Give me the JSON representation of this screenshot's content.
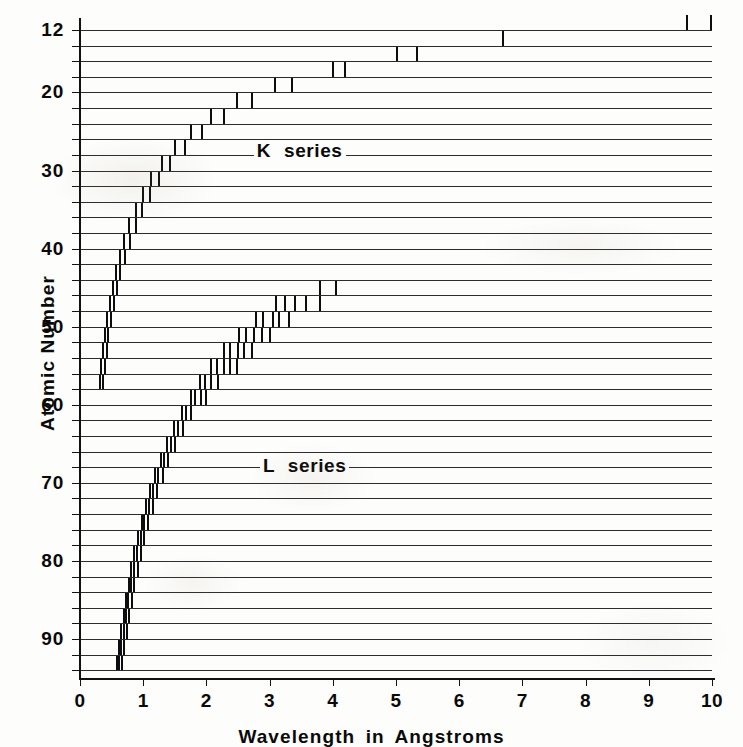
{
  "figure": {
    "title": "",
    "background_color": "#fdfdfb",
    "ink_color": "#0d0d0d"
  },
  "axes": {
    "x": {
      "title": "Wavelength in Angstroms",
      "ticks": [
        "0",
        "1",
        "2",
        "3",
        "4",
        "5",
        "6",
        "7",
        "8",
        "9",
        "10"
      ],
      "min": 0,
      "max": 10,
      "px_min": 80,
      "px_max": 712
    },
    "y": {
      "title": "Atomic Number",
      "ticks": [
        "12",
        "20",
        "30",
        "40",
        "50",
        "60",
        "70",
        "80",
        "90"
      ],
      "tick_values": [
        12,
        20,
        30,
        40,
        50,
        60,
        70,
        80,
        90
      ],
      "min": 12,
      "max": 95,
      "px_min": 30,
      "px_max": 678,
      "inverted": true
    }
  },
  "annotations": [
    {
      "text": "K  series",
      "x_angstrom": 2.75,
      "atomic_number": 27.5,
      "name": "k-series-label"
    },
    {
      "text": "L  series",
      "x_angstrom": 2.85,
      "atomic_number": 67.8,
      "name": "l-series-label"
    }
  ],
  "chart_data": {
    "type": "line",
    "xlabel": "Wavelength in Angstroms",
    "ylabel": "Atomic Number",
    "xlim": [
      0,
      10
    ],
    "ylim": [
      12,
      95
    ],
    "y_inverted": true,
    "grid": true,
    "legend": [
      "K series",
      "L series"
    ],
    "legend_position": "inline-annotation",
    "rows": [
      {
        "z": 12,
        "k_lines": [
          9.6,
          9.99
        ],
        "l_lines": []
      },
      {
        "z": 14,
        "k_lines": [
          6.7
        ],
        "l_lines": []
      },
      {
        "z": 16,
        "k_lines": [
          5.02,
          5.34
        ],
        "l_lines": []
      },
      {
        "z": 18,
        "k_lines": [
          4.0,
          4.2
        ],
        "l_lines": []
      },
      {
        "z": 20,
        "k_lines": [
          3.09,
          3.35
        ],
        "l_lines": []
      },
      {
        "z": 22,
        "k_lines": [
          2.49,
          2.72
        ],
        "l_lines": []
      },
      {
        "z": 24,
        "k_lines": [
          2.08,
          2.28
        ],
        "l_lines": []
      },
      {
        "z": 26,
        "k_lines": [
          1.75,
          1.93
        ],
        "l_lines": []
      },
      {
        "z": 28,
        "k_lines": [
          1.5,
          1.66
        ],
        "l_lines": []
      },
      {
        "z": 30,
        "k_lines": [
          1.29,
          1.43
        ],
        "l_lines": []
      },
      {
        "z": 32,
        "k_lines": [
          1.13,
          1.25
        ],
        "l_lines": []
      },
      {
        "z": 34,
        "k_lines": [
          0.99,
          1.1
        ],
        "l_lines": []
      },
      {
        "z": 36,
        "k_lines": [
          0.88,
          0.98
        ],
        "l_lines": []
      },
      {
        "z": 38,
        "k_lines": [
          0.78,
          0.88
        ],
        "l_lines": []
      },
      {
        "z": 40,
        "k_lines": [
          0.7,
          0.79
        ],
        "l_lines": []
      },
      {
        "z": 42,
        "k_lines": [
          0.63,
          0.71
        ],
        "l_lines": []
      },
      {
        "z": 44,
        "k_lines": [
          0.57,
          0.64
        ],
        "l_lines": []
      },
      {
        "z": 46,
        "k_lines": [
          0.52,
          0.59
        ],
        "l_lines": [
          3.8,
          4.05
        ]
      },
      {
        "z": 48,
        "k_lines": [
          0.47,
          0.54
        ],
        "l_lines": [
          3.1,
          3.25,
          3.4,
          3.58,
          3.8
        ]
      },
      {
        "z": 50,
        "k_lines": [
          0.43,
          0.49
        ],
        "l_lines": [
          2.78,
          2.9,
          3.05,
          3.15,
          3.3
        ]
      },
      {
        "z": 52,
        "k_lines": [
          0.4,
          0.45
        ],
        "l_lines": [
          2.52,
          2.63,
          2.75,
          2.88,
          3.0
        ]
      },
      {
        "z": 54,
        "k_lines": [
          0.37,
          0.42
        ],
        "l_lines": [
          2.28,
          2.38,
          2.5,
          2.6,
          2.72
        ]
      },
      {
        "z": 56,
        "k_lines": [
          0.34,
          0.39
        ],
        "l_lines": [
          2.08,
          2.17,
          2.28,
          2.38,
          2.48
        ]
      },
      {
        "z": 58,
        "k_lines": [
          0.31,
          0.36
        ],
        "l_lines": [
          1.9,
          1.98,
          2.08,
          2.18
        ]
      },
      {
        "z": 60,
        "k_lines": [],
        "l_lines": [
          1.75,
          1.82,
          1.91,
          2.0
        ]
      },
      {
        "z": 62,
        "k_lines": [],
        "l_lines": [
          1.61,
          1.68,
          1.76
        ]
      },
      {
        "z": 64,
        "k_lines": [],
        "l_lines": [
          1.49,
          1.55,
          1.63
        ]
      },
      {
        "z": 66,
        "k_lines": [],
        "l_lines": [
          1.38,
          1.44,
          1.51
        ]
      },
      {
        "z": 68,
        "k_lines": [],
        "l_lines": [
          1.28,
          1.33,
          1.4
        ]
      },
      {
        "z": 70,
        "k_lines": [],
        "l_lines": [
          1.19,
          1.24,
          1.31
        ]
      },
      {
        "z": 72,
        "k_lines": [],
        "l_lines": [
          1.11,
          1.16,
          1.22
        ]
      },
      {
        "z": 74,
        "k_lines": [],
        "l_lines": [
          1.04,
          1.09,
          1.15
        ]
      },
      {
        "z": 76,
        "k_lines": [],
        "l_lines": [
          0.98,
          1.02,
          1.08
        ]
      },
      {
        "z": 78,
        "k_lines": [],
        "l_lines": [
          0.92,
          0.96,
          1.02
        ]
      },
      {
        "z": 80,
        "k_lines": [],
        "l_lines": [
          0.86,
          0.9,
          0.96
        ]
      },
      {
        "z": 82,
        "k_lines": [],
        "l_lines": [
          0.81,
          0.85,
          0.91
        ]
      },
      {
        "z": 84,
        "k_lines": [],
        "l_lines": [
          0.77,
          0.81,
          0.86
        ]
      },
      {
        "z": 86,
        "k_lines": [],
        "l_lines": [
          0.73,
          0.76,
          0.82
        ]
      },
      {
        "z": 88,
        "k_lines": [],
        "l_lines": [
          0.69,
          0.72,
          0.78
        ]
      },
      {
        "z": 90,
        "k_lines": [],
        "l_lines": [
          0.65,
          0.69,
          0.74
        ]
      },
      {
        "z": 92,
        "k_lines": [],
        "l_lines": [
          0.62,
          0.65,
          0.7
        ]
      },
      {
        "z": 94,
        "k_lines": [],
        "l_lines": [
          0.59,
          0.62,
          0.67
        ]
      }
    ]
  }
}
